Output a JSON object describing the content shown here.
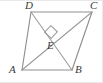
{
  "figure": {
    "kind": "geometry-diagram",
    "canvas": {
      "width": 103,
      "height": 83
    },
    "style": {
      "background_color": "#ffffff",
      "stroke_color": "#8f8f8f",
      "stroke_color_dark": "#7b7b7b",
      "label_color": "#3a3a3a",
      "stroke_width": 1.1
    },
    "vertices": [
      {
        "id": "A",
        "label": "A",
        "x": 22,
        "y": 70,
        "label_x": 11,
        "label_y": 64
      },
      {
        "id": "B",
        "label": "B",
        "x": 72,
        "y": 70,
        "label_x": 75,
        "label_y": 64
      },
      {
        "id": "C",
        "label": "C",
        "x": 92,
        "y": 12,
        "label_x": 90,
        "label_y": 0
      },
      {
        "id": "D",
        "label": "D",
        "x": 31,
        "y": 12,
        "label_x": 25,
        "label_y": 0
      },
      {
        "id": "E",
        "label": "E",
        "x": 52,
        "y": 38,
        "label_x": 47,
        "label_y": 40
      }
    ],
    "edges": [
      {
        "name": "side-AB",
        "from": "A",
        "to": "B"
      },
      {
        "name": "side-BC",
        "from": "B",
        "to": "C"
      },
      {
        "name": "side-CD",
        "from": "C",
        "to": "D"
      },
      {
        "name": "side-DA",
        "from": "D",
        "to": "A"
      }
    ],
    "diagonals": [
      {
        "name": "diagonal-AC",
        "from": "A",
        "to": "C"
      },
      {
        "name": "diagonal-BD",
        "from": "B",
        "to": "D"
      }
    ],
    "right_angle_mark": {
      "name": "right-angle-mark-at-E",
      "at": "E",
      "center_x": 51,
      "center_y": 32,
      "size": 9,
      "rotation_deg": 43
    }
  }
}
